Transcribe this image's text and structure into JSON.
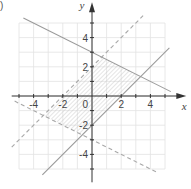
{
  "panel_label": ")",
  "chart_data": {
    "type": "line",
    "title": "",
    "xlabel": "x",
    "ylabel": "y",
    "xlim": [
      -5.5,
      5.5
    ],
    "ylim": [
      -5.5,
      5.8
    ],
    "grid": true,
    "grid_range": {
      "x": [
        -5,
        5
      ],
      "y": [
        -5,
        5
      ],
      "step": 1
    },
    "x_tick_labels": [
      "-4",
      "-2",
      "0",
      "2",
      "4"
    ],
    "y_tick_labels": [
      "4",
      "2",
      "-2",
      "-4"
    ],
    "origin_label": "0",
    "series": [
      {
        "name": "y = -0.5x + 3",
        "style": "solid",
        "slope": -0.5,
        "intercept": 3,
        "x_range": [
          -4.7,
          5.4
        ]
      },
      {
        "name": "y = x - 2",
        "style": "solid",
        "slope": 1,
        "intercept": -2,
        "x_range": [
          -3.4,
          5.3
        ]
      },
      {
        "name": "y = x + 2",
        "style": "dashed",
        "slope": 1,
        "intercept": 2,
        "x_range": [
          -5.5,
          3.5
        ]
      },
      {
        "name": "y = -0.5x - 3",
        "style": "dashed",
        "slope": -0.5,
        "intercept": -3,
        "x_range": [
          -5.3,
          4.4
        ]
      }
    ],
    "shaded_region": {
      "description": "feasible region (hatched parallelogram)",
      "vertices": [
        [
          0.667,
          2.667
        ],
        [
          3.333,
          1.333
        ],
        [
          -0.667,
          -2.667
        ],
        [
          -3.333,
          -1.333
        ]
      ]
    },
    "colors": {
      "solid": "#9a9a9a",
      "dashed": "#a8a8a8",
      "grid": "#e2e2e2",
      "axis": "#333333",
      "hatch": "#c8c8c8"
    }
  }
}
